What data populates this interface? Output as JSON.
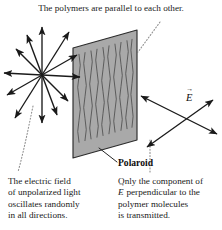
{
  "figure": {
    "background_color": "#ffffff",
    "ink_color": "#1a1a1a"
  },
  "captions": {
    "top": "The polymers are parallel to each other.",
    "left": {
      "lines": [
        "The electric field",
        "of unpolarized light",
        "oscillates randomly",
        "in all directions."
      ]
    },
    "right": {
      "line1": "Only the component of",
      "line2_vector": "E",
      "line2_rest": " perpendicular to the",
      "line3": "polymer molecules",
      "line4": "is transmitted."
    }
  },
  "labels": {
    "polaroid": "Polaroid",
    "e_field_vector": "E"
  },
  "sheet": {
    "fill_color": "#a9a9a9",
    "edge_color": "#2b2b2b",
    "polymer_line_color": "#4a4a4a",
    "polymer_strand_count": 11,
    "corners": {
      "top_left": [
        73,
        48
      ],
      "top_right": [
        137,
        30
      ],
      "bottom_right": [
        137,
        140
      ],
      "bottom_left": [
        73,
        158
      ]
    }
  },
  "unpolarized_burst": {
    "center": [
      42,
      75
    ],
    "description": "double-headed arrows radiating in all directions",
    "ray_count": 6,
    "ray_angles_deg": [
      90,
      55,
      20,
      160,
      125,
      0
    ],
    "ray_length": 48
  },
  "transmitted_light": {
    "crossing_point": [
      182,
      116
    ],
    "arrow_count": 2,
    "description": "double-headed arrows for the transmitted polarized component"
  },
  "leader_lines": {
    "style": "dotted",
    "color": "#8a8a8a",
    "polaroid_leader_style": "solid"
  }
}
